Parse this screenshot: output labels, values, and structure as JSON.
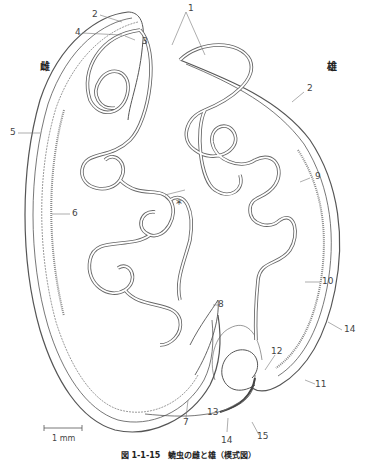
{
  "figure": {
    "caption": "図 1-1-15　蟯虫の雌と雄（模式図）",
    "sex_labels": {
      "female": "雌",
      "male": "雄"
    },
    "asterisk": "*",
    "scale_bar": {
      "label": "1 mm"
    },
    "labels": [
      {
        "id": "1",
        "text": "1"
      },
      {
        "id": "2a",
        "text": "2"
      },
      {
        "id": "3",
        "text": "3"
      },
      {
        "id": "4",
        "text": "4"
      },
      {
        "id": "2b",
        "text": "2"
      },
      {
        "id": "5",
        "text": "5"
      },
      {
        "id": "6",
        "text": "6"
      },
      {
        "id": "7",
        "text": "7"
      },
      {
        "id": "8",
        "text": "8"
      },
      {
        "id": "9",
        "text": "9"
      },
      {
        "id": "10",
        "text": "10"
      },
      {
        "id": "11",
        "text": "11"
      },
      {
        "id": "12",
        "text": "12"
      },
      {
        "id": "13",
        "text": "13"
      },
      {
        "id": "14a",
        "text": "14"
      },
      {
        "id": "14b",
        "text": "14"
      },
      {
        "id": "15",
        "text": "15"
      }
    ]
  }
}
